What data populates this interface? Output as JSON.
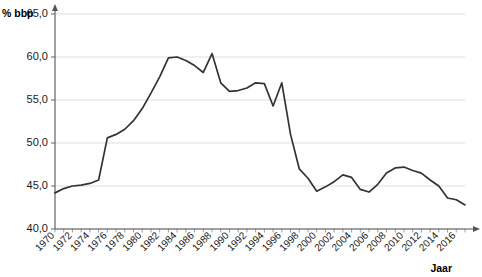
{
  "chart_data": {
    "type": "line",
    "title": "",
    "xlabel": "Jaar",
    "ylabel": "% bbp",
    "ylim": [
      40.0,
      65.0
    ],
    "yticks": [
      "65,0",
      "60,0",
      "55,0",
      "50,0",
      "45,0",
      "40,0"
    ],
    "ytick_values": [
      65.0,
      60.0,
      55.0,
      50.0,
      45.0,
      40.0
    ],
    "xlim": [
      1970,
      2017
    ],
    "xticks": [
      "1970",
      "1972",
      "1974",
      "1976",
      "1978",
      "1980",
      "1982",
      "1984",
      "1986",
      "1988",
      "1990",
      "1992",
      "1994",
      "1996",
      "1998",
      "2000",
      "2002",
      "2004",
      "2006",
      "2008",
      "2010",
      "2012",
      "2014",
      "2016"
    ],
    "xtick_values": [
      1970,
      1972,
      1974,
      1976,
      1978,
      1980,
      1982,
      1984,
      1986,
      1988,
      1990,
      1992,
      1994,
      1996,
      1998,
      2000,
      2002,
      2004,
      2006,
      2008,
      2010,
      2012,
      2014,
      2016
    ],
    "grid": true,
    "legend": "none",
    "line_color": "#333333",
    "grid_color": "#d9d9d9",
    "x": [
      1970,
      1971,
      1972,
      1973,
      1974,
      1975,
      1976,
      1977,
      1978,
      1979,
      1980,
      1981,
      1982,
      1983,
      1984,
      1985,
      1986,
      1987,
      1988,
      1989,
      1990,
      1991,
      1992,
      1993,
      1994,
      1995,
      1996,
      1997,
      1998,
      1999,
      2000,
      2001,
      2002,
      2003,
      2004,
      2005,
      2006,
      2007,
      2008,
      2009,
      2010,
      2011,
      2012,
      2013,
      2014,
      2015,
      2016,
      2017
    ],
    "values": [
      44.2,
      44.7,
      45.0,
      45.1,
      45.3,
      45.7,
      50.6,
      51.0,
      51.6,
      52.6,
      54.0,
      55.8,
      57.7,
      59.9,
      60.0,
      59.6,
      59.0,
      58.2,
      60.4,
      57.0,
      56.0,
      56.1,
      56.4,
      57.0,
      56.9,
      54.3,
      57.0,
      51.0,
      47.0,
      45.9,
      44.4,
      44.9,
      45.5,
      46.3,
      46.0,
      44.6,
      44.3,
      45.2,
      46.5,
      47.1,
      47.2,
      46.8,
      46.5,
      45.7,
      45.0,
      43.6,
      43.4,
      42.8
    ]
  },
  "axis_titles": {
    "y": "% bbp",
    "x": "Jaar"
  }
}
